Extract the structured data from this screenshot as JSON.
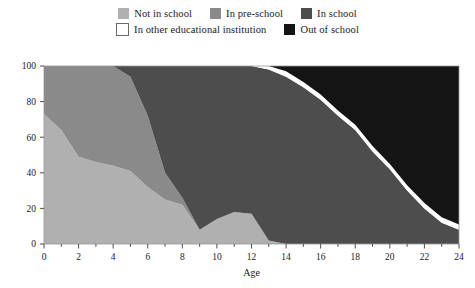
{
  "legend": {
    "rows": [
      [
        {
          "label": "Not in school",
          "color": "#b0b0b0",
          "border": "none"
        },
        {
          "label": "In pre-school",
          "color": "#8a8a8a",
          "border": "none"
        },
        {
          "label": "In school",
          "color": "#4d4d4d",
          "border": "none"
        }
      ],
      [
        {
          "label": "In other educational institution",
          "color": "#ffffff",
          "border": "1px solid #6b6b6b"
        },
        {
          "label": "Out of school",
          "color": "#141414",
          "border": "none"
        }
      ]
    ]
  },
  "chart_data": {
    "type": "area",
    "stacked": true,
    "title": "",
    "xlabel": "Age",
    "ylabel": "",
    "xlim": [
      0,
      24
    ],
    "ylim": [
      0,
      100
    ],
    "xticks": [
      0,
      2,
      4,
      6,
      8,
      10,
      12,
      14,
      16,
      18,
      20,
      22,
      24
    ],
    "xtick_labels": [
      "0",
      "2",
      "4",
      "6",
      "8",
      "10",
      "12",
      "14",
      "16",
      "18",
      "20",
      "22",
      "24"
    ],
    "xminor_step": 1,
    "yticks": [
      0,
      20,
      40,
      60,
      80,
      100
    ],
    "ytick_labels": [
      "0",
      "20",
      "40",
      "60",
      "80",
      "100"
    ],
    "grid": false,
    "legend_position": "top",
    "x": [
      0,
      1,
      2,
      3,
      4,
      5,
      6,
      7,
      8,
      9,
      10,
      11,
      12,
      13,
      14,
      15,
      16,
      17,
      18,
      19,
      20,
      21,
      22,
      23,
      24
    ],
    "series": [
      {
        "name": "Not in school",
        "color": "#b0b0b0",
        "values": [
          73,
          64,
          49,
          46,
          44,
          41,
          32,
          25,
          22,
          8,
          14,
          18,
          17,
          2,
          0,
          0,
          0,
          0,
          0,
          0,
          0,
          0,
          0,
          0,
          0
        ]
      },
      {
        "name": "In pre-school",
        "color": "#8a8a8a",
        "values": [
          27,
          36,
          51,
          54,
          56,
          53,
          40,
          15,
          4,
          0,
          0,
          0,
          0,
          0,
          0,
          0,
          0,
          0,
          0,
          0,
          0,
          0,
          0,
          0,
          0
        ]
      },
      {
        "name": "In school",
        "color": "#4d4d4d",
        "values": [
          0,
          0,
          0,
          0,
          0,
          6,
          28,
          60,
          74,
          92,
          86,
          82,
          83,
          96,
          94,
          88,
          81,
          72,
          64,
          52,
          42,
          30,
          20,
          12,
          8
        ]
      },
      {
        "name": "In other educational institution",
        "color": "#ffffff",
        "values": [
          0,
          0,
          0,
          0,
          0,
          0,
          0,
          0,
          0,
          0,
          0,
          0,
          0,
          2,
          3,
          3,
          3,
          3,
          3,
          3,
          3,
          3,
          3,
          3,
          3
        ]
      },
      {
        "name": "Out of school",
        "color": "#141414",
        "values": [
          0,
          0,
          0,
          0,
          0,
          0,
          0,
          0,
          0,
          0,
          0,
          0,
          0,
          0,
          3,
          9,
          16,
          25,
          33,
          45,
          55,
          67,
          77,
          85,
          89
        ]
      }
    ]
  }
}
